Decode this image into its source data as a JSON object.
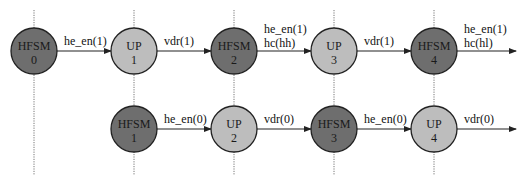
{
  "colors": {
    "hfsm_fill": "#6e6e6e",
    "up_fill": "#bdbdbd",
    "line": "#222222",
    "guide": "#777777"
  },
  "guides": [
    {
      "x": 34
    },
    {
      "x": 134
    },
    {
      "x": 234
    },
    {
      "x": 334
    },
    {
      "x": 434
    }
  ],
  "top_row": {
    "y": 51,
    "nodes": [
      {
        "type": "HFSM",
        "name": "HFSM",
        "index": "0",
        "x": 34
      },
      {
        "type": "UP",
        "name": "UP",
        "index": "1",
        "x": 134
      },
      {
        "type": "HFSM",
        "name": "HFSM",
        "index": "2",
        "x": 234
      },
      {
        "type": "UP",
        "name": "UP",
        "index": "3",
        "x": 334
      },
      {
        "type": "HFSM",
        "name": "HFSM",
        "index": "4",
        "x": 434
      }
    ],
    "edges": [
      {
        "lines": [
          "he_en(1)"
        ]
      },
      {
        "lines": [
          "vdr(1)"
        ]
      },
      {
        "lines": [
          "he_en(1)",
          "hc(hh)"
        ]
      },
      {
        "lines": [
          "vdr(1)"
        ]
      },
      {
        "lines": [
          "he_en(1)",
          "hc(hl)"
        ]
      }
    ]
  },
  "bottom_row": {
    "y": 129,
    "nodes": [
      {
        "type": "HFSM",
        "name": "HFSM",
        "index": "1",
        "x": 134
      },
      {
        "type": "UP",
        "name": "UP",
        "index": "2",
        "x": 234
      },
      {
        "type": "HFSM",
        "name": "HFSM",
        "index": "3",
        "x": 334
      },
      {
        "type": "UP",
        "name": "UP",
        "index": "4",
        "x": 434
      }
    ],
    "edges": [
      {
        "lines": [
          "he_en(0)"
        ]
      },
      {
        "lines": [
          "vdr(0)"
        ]
      },
      {
        "lines": [
          "he_en(0)"
        ]
      },
      {
        "lines": [
          "vdr(0)"
        ]
      }
    ]
  }
}
